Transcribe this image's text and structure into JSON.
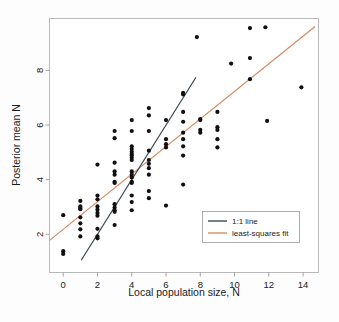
{
  "chart_data": {
    "type": "scatter",
    "title": "",
    "xlabel": "Local population size, N",
    "ylabel": "Posterior mean N",
    "xlim": [
      -0.8,
      14.9
    ],
    "ylim": [
      0.6,
      9.9
    ],
    "xticks": [
      0,
      2,
      4,
      6,
      8,
      10,
      12,
      14
    ],
    "yticks": [
      2,
      4,
      6,
      8
    ],
    "grid": false,
    "legend_position": "bottom-right",
    "legend": [
      {
        "label": "1:1 line",
        "color": "#3c4a52",
        "type": "line"
      },
      {
        "label": "least-squares fit",
        "color": "#d98a63",
        "type": "line"
      }
    ],
    "series": [
      {
        "name": "posterior mean vs local population size",
        "type": "scatter",
        "marker": "filled-circle",
        "color": "#101010",
        "points": [
          [
            0,
            2.7
          ],
          [
            0,
            1.38
          ],
          [
            0,
            1.28
          ],
          [
            1,
            3.22
          ],
          [
            1,
            3.02
          ],
          [
            1,
            2.96
          ],
          [
            1,
            2.92
          ],
          [
            1,
            2.62
          ],
          [
            1,
            2.4
          ],
          [
            1,
            2.18
          ],
          [
            1,
            1.92
          ],
          [
            2,
            4.55
          ],
          [
            2,
            3.42
          ],
          [
            2,
            3.28
          ],
          [
            2,
            3.02
          ],
          [
            2,
            2.9
          ],
          [
            2,
            2.78
          ],
          [
            2,
            2.68
          ],
          [
            2,
            2.2
          ],
          [
            2,
            1.92
          ],
          [
            2,
            1.85
          ],
          [
            3,
            5.78
          ],
          [
            3,
            5.52
          ],
          [
            3,
            4.62
          ],
          [
            3,
            4.3
          ],
          [
            3,
            4.18
          ],
          [
            3,
            3.92
          ],
          [
            3,
            3.88
          ],
          [
            3,
            3.1
          ],
          [
            3,
            2.98
          ],
          [
            3,
            2.88
          ],
          [
            3,
            2.82
          ],
          [
            3,
            2.34
          ],
          [
            4,
            6.18
          ],
          [
            4,
            5.78
          ],
          [
            4,
            5.22
          ],
          [
            4,
            5.12
          ],
          [
            4,
            5.02
          ],
          [
            4,
            4.94
          ],
          [
            4,
            4.88
          ],
          [
            4,
            4.8
          ],
          [
            4,
            4.72
          ],
          [
            4,
            4.3
          ],
          [
            4,
            4.18
          ],
          [
            4,
            4.08
          ],
          [
            4,
            3.92
          ],
          [
            4,
            3.88
          ],
          [
            4,
            3.42
          ],
          [
            4,
            3.18
          ],
          [
            4,
            2.88
          ],
          [
            5,
            6.62
          ],
          [
            5,
            6.35
          ],
          [
            5,
            5.78
          ],
          [
            5,
            5.06
          ],
          [
            5,
            4.72
          ],
          [
            5,
            4.58
          ],
          [
            5,
            4.42
          ],
          [
            5,
            4.18
          ],
          [
            5,
            3.58
          ],
          [
            5,
            3.32
          ],
          [
            6,
            6.18
          ],
          [
            6,
            5.48
          ],
          [
            6,
            5.3
          ],
          [
            6,
            5.18
          ],
          [
            6,
            3.05
          ],
          [
            7,
            7.18
          ],
          [
            7,
            7.12
          ],
          [
            7,
            6.48
          ],
          [
            7,
            6.12
          ],
          [
            7,
            5.72
          ],
          [
            7,
            5.48
          ],
          [
            7,
            5.22
          ],
          [
            7,
            4.88
          ],
          [
            7,
            3.82
          ],
          [
            8,
            6.22
          ],
          [
            8,
            6.18
          ],
          [
            8,
            5.82
          ],
          [
            8,
            5.72
          ],
          [
            9,
            6.48
          ],
          [
            9,
            5.92
          ],
          [
            9,
            5.82
          ],
          [
            9,
            5.48
          ],
          [
            9,
            5.18
          ],
          [
            7.8,
            9.22
          ],
          [
            9.8,
            8.25
          ],
          [
            10.9,
            9.55
          ],
          [
            10.9,
            8.45
          ],
          [
            10.9,
            7.68
          ],
          [
            11.8,
            9.58
          ],
          [
            11.9,
            6.15
          ],
          [
            13.9,
            7.38
          ]
        ]
      }
    ],
    "reference_lines": [
      {
        "name": "1:1 line",
        "color": "#3c4a52",
        "slope": 1,
        "intercept": 0,
        "x_start": 1.05,
        "x_end": 7.75
      },
      {
        "name": "least-squares fit",
        "color": "#d98a63",
        "slope": 0.505,
        "intercept": 2.18,
        "x_start": -0.8,
        "x_end": 14.7
      }
    ]
  },
  "axes": {
    "x_label": "Local population size, N",
    "y_label": "Posterior mean N",
    "x_tick_labels": [
      "0",
      "2",
      "4",
      "6",
      "8",
      "10",
      "12",
      "14"
    ],
    "y_tick_labels": [
      "2",
      "4",
      "6",
      "8"
    ]
  },
  "legend": {
    "items": [
      {
        "label": "1:1 line"
      },
      {
        "label": "least-squares fit"
      }
    ]
  },
  "colors": {
    "one_to_one_line": "#3c4a52",
    "fit_line": "#d98a63",
    "marker": "#101010",
    "frame": "#b8b8b8",
    "background": "#fdfdfd"
  }
}
